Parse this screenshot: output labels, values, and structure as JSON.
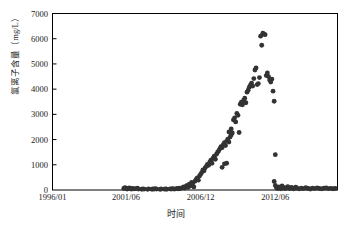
{
  "chart_data": {
    "type": "scatter",
    "title": "",
    "xlabel": "时间",
    "ylabel": "氯离子含量（mg/L）",
    "ylim": [
      0,
      7000
    ],
    "y_ticks": [
      0,
      1000,
      2000,
      3000,
      4000,
      5000,
      6000,
      7000
    ],
    "y_tick_labels": [
      "0",
      "1000",
      "2000",
      "3000",
      "4000",
      "5000",
      "6000",
      "7000"
    ],
    "x_tick_labels": [
      "1996/01",
      "2001/06",
      "2006/12",
      "2012/06"
    ],
    "x_tick_positions_months": [
      0,
      65,
      131,
      197
    ],
    "x_axis_unit": "months since 1996/01",
    "xlim_months": [
      0,
      252
    ],
    "grid": false,
    "legend": null,
    "marker": {
      "shape": "circle",
      "color": "#333333",
      "size_px": 2.4
    },
    "frame": {
      "box": true,
      "color": "#000000"
    },
    "series": [
      {
        "name": "氯离子含量",
        "points": [
          [
            63,
            60
          ],
          [
            64,
            95
          ],
          [
            65,
            70
          ],
          [
            66,
            40
          ],
          [
            67,
            55
          ],
          [
            68,
            85
          ],
          [
            69,
            50
          ],
          [
            70,
            35
          ],
          [
            71,
            62
          ],
          [
            72,
            45
          ],
          [
            74,
            58
          ],
          [
            75,
            72
          ],
          [
            76,
            40
          ],
          [
            79,
            30
          ],
          [
            80,
            48
          ],
          [
            81,
            38
          ],
          [
            84,
            25
          ],
          [
            85,
            42
          ],
          [
            88,
            30
          ],
          [
            89,
            45
          ],
          [
            90,
            38
          ],
          [
            91,
            52
          ],
          [
            92,
            35
          ],
          [
            95,
            28
          ],
          [
            96,
            40
          ],
          [
            99,
            34
          ],
          [
            100,
            48
          ],
          [
            101,
            30
          ],
          [
            104,
            44
          ],
          [
            105,
            36
          ],
          [
            106,
            55
          ],
          [
            107,
            42
          ],
          [
            108,
            38
          ],
          [
            110,
            60
          ],
          [
            111,
            48
          ],
          [
            112,
            70
          ],
          [
            113,
            55
          ],
          [
            115,
            90
          ],
          [
            116,
            120
          ],
          [
            117,
            75
          ],
          [
            118,
            140
          ],
          [
            119,
            180
          ],
          [
            120,
            110
          ],
          [
            121,
            230
          ],
          [
            122,
            160
          ],
          [
            123,
            300
          ],
          [
            124,
            260
          ],
          [
            125,
            120
          ],
          [
            126,
            350
          ],
          [
            127,
            420
          ],
          [
            128,
            480
          ],
          [
            129,
            390
          ],
          [
            130,
            560
          ],
          [
            131,
            620
          ],
          [
            132,
            700
          ],
          [
            133,
            800
          ],
          [
            134,
            760
          ],
          [
            135,
            880
          ],
          [
            136,
            940
          ],
          [
            137,
            1020
          ],
          [
            138,
            980
          ],
          [
            139,
            1100
          ],
          [
            140,
            1180
          ],
          [
            141,
            1060
          ],
          [
            142,
            1260
          ],
          [
            143,
            1340
          ],
          [
            144,
            1220
          ],
          [
            145,
            1420
          ],
          [
            146,
            1500
          ],
          [
            147,
            1560
          ],
          [
            148,
            1640
          ],
          [
            149,
            1720
          ],
          [
            150,
            1680
          ],
          [
            151,
            1800
          ],
          [
            152,
            1880
          ],
          [
            153,
            1760
          ],
          [
            154,
            1940
          ],
          [
            155,
            2020
          ],
          [
            156,
            1900
          ],
          [
            157,
            2100
          ],
          [
            158,
            2180
          ],
          [
            159,
            2260
          ],
          [
            150,
            900
          ],
          [
            152,
            1040
          ],
          [
            154,
            1060
          ],
          [
            156,
            2300
          ],
          [
            158,
            2420
          ],
          [
            160,
            2780
          ],
          [
            161,
            2860
          ],
          [
            162,
            2700
          ],
          [
            163,
            3040
          ],
          [
            164,
            2960
          ],
          [
            165,
            2280
          ],
          [
            166,
            3400
          ],
          [
            167,
            3480
          ],
          [
            168,
            3380
          ],
          [
            169,
            3560
          ],
          [
            170,
            3640
          ],
          [
            171,
            3460
          ],
          [
            172,
            3880
          ],
          [
            173,
            3960
          ],
          [
            174,
            4080
          ],
          [
            175,
            4160
          ],
          [
            176,
            4240
          ],
          [
            177,
            4120
          ],
          [
            178,
            4420
          ],
          [
            179,
            4760
          ],
          [
            180,
            4840
          ],
          [
            181,
            4180
          ],
          [
            182,
            4220
          ],
          [
            183,
            4460
          ],
          [
            184,
            6100
          ],
          [
            185,
            5740
          ],
          [
            186,
            6220
          ],
          [
            187,
            6180
          ],
          [
            188,
            6160
          ],
          [
            189,
            4540
          ],
          [
            190,
            4640
          ],
          [
            191,
            4500
          ],
          [
            192,
            4360
          ],
          [
            193,
            4280
          ],
          [
            194,
            4400
          ],
          [
            195,
            3920
          ],
          [
            196,
            3520
          ],
          [
            197,
            1400
          ],
          [
            196,
            340
          ],
          [
            197,
            180
          ],
          [
            198,
            90
          ],
          [
            199,
            60
          ],
          [
            200,
            120
          ],
          [
            201,
            80
          ],
          [
            202,
            45
          ],
          [
            203,
            160
          ],
          [
            204,
            100
          ],
          [
            205,
            70
          ],
          [
            206,
            55
          ],
          [
            207,
            90
          ],
          [
            208,
            130
          ],
          [
            209,
            75
          ],
          [
            210,
            60
          ],
          [
            211,
            100
          ],
          [
            212,
            85
          ],
          [
            213,
            50
          ],
          [
            214,
            65
          ],
          [
            215,
            110
          ],
          [
            216,
            80
          ],
          [
            218,
            45
          ],
          [
            220,
            70
          ],
          [
            222,
            55
          ],
          [
            224,
            90
          ],
          [
            226,
            60
          ],
          [
            228,
            40
          ],
          [
            230,
            75
          ],
          [
            232,
            55
          ],
          [
            234,
            85
          ],
          [
            236,
            60
          ],
          [
            238,
            45
          ],
          [
            240,
            70
          ],
          [
            242,
            80
          ],
          [
            244,
            55
          ],
          [
            246,
            65
          ],
          [
            248,
            50
          ],
          [
            250,
            60
          ]
        ]
      }
    ]
  }
}
